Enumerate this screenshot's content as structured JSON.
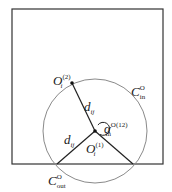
{
  "diagram": {
    "colors": {
      "box": "#333333",
      "circle": "#8a8a8a",
      "radius": "#222222",
      "text": "#222222"
    },
    "box": {
      "x": 12,
      "y": 9,
      "w": 151,
      "h": 155
    },
    "circle": {
      "cx": 95,
      "cy": 131,
      "r": 52
    },
    "points": {
      "center": {
        "x": 95,
        "y": 131
      },
      "o2": {
        "x": 72,
        "y": 83
      },
      "left_intersection": {
        "x": 57,
        "y": 164
      },
      "right_intersection": {
        "x": 133,
        "y": 164
      }
    },
    "labels": {
      "o2": {
        "base": "O",
        "sub": "i",
        "sup": "(2)"
      },
      "c_in": {
        "base": "C",
        "sub": "in",
        "sup": "O"
      },
      "d_upper": {
        "base": "d",
        "sub": "ij"
      },
      "alpha": {
        "base": "α",
        "sub": "in",
        "sup": "O(12)"
      },
      "d_lower": {
        "base": "d",
        "sub": "ij"
      },
      "o1": {
        "base": "O",
        "sub": "i",
        "sup": "(1)"
      },
      "c_out": {
        "base": "C",
        "sub": "out",
        "sup": "O"
      }
    }
  }
}
